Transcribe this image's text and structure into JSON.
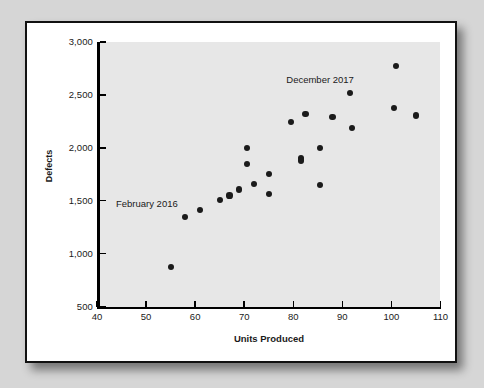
{
  "figure": {
    "background_color": "#d6d6d6",
    "panel_color": "#ffffff",
    "plot_area_color": "#e7e7e7",
    "point_color": "#1b1b1b"
  },
  "chart_data": {
    "type": "scatter",
    "title": "",
    "xlabel": "Units Produced",
    "ylabel": "Defects",
    "xlim": [
      40,
      110
    ],
    "ylim": [
      500,
      3000
    ],
    "xticks": [
      "40",
      "50",
      "60",
      "70",
      "80",
      "90",
      "100",
      "110"
    ],
    "xtick_values": [
      40,
      50,
      60,
      70,
      80,
      90,
      100,
      110
    ],
    "yticks": [
      "500",
      "1,000",
      "1,500",
      "2,000",
      "2,500",
      "3,000"
    ],
    "ytick_values": [
      500,
      1000,
      1500,
      2000,
      2500,
      3000
    ],
    "grid": false,
    "legend": null,
    "series": [
      {
        "name": "Defects vs Units Produced",
        "points": [
          [
            55,
            870
          ],
          [
            58,
            1345
          ],
          [
            61,
            1410
          ],
          [
            65,
            1510
          ],
          [
            67,
            1550
          ],
          [
            69,
            1605
          ],
          [
            70.5,
            2000
          ],
          [
            70.5,
            1845
          ],
          [
            72,
            1655
          ],
          [
            75,
            1750
          ],
          [
            75,
            1565
          ],
          [
            79.5,
            2245
          ],
          [
            81.5,
            1905
          ],
          [
            81.5,
            1880
          ],
          [
            82.5,
            2320
          ],
          [
            85.5,
            2000
          ],
          [
            85.5,
            1650
          ],
          [
            88,
            2290
          ],
          [
            91.5,
            2515
          ],
          [
            92,
            2190
          ],
          [
            100.5,
            2380
          ],
          [
            101,
            2775
          ],
          [
            105,
            2305
          ]
        ]
      }
    ],
    "annotations": [
      {
        "text": "February 2016",
        "x": 56.5,
        "y": 1465,
        "align": "right"
      },
      {
        "text": "December 2017",
        "x": 85.5,
        "y": 2640,
        "align": "center"
      }
    ]
  }
}
